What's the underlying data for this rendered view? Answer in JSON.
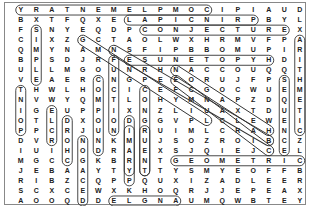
{
  "puzzle": {
    "type": "word-search",
    "rows": [
      "YRATNEMELPMOCIPIAUD",
      "BXTFQXELAPICNIRPBYL",
      "FSNYEQDPCONJECTUREX",
      "CIXZGCTAOLWXHRMVFPA",
      "QMYNAMNSFIPBBOMUPIR",
      "BPSDJRFESUNETOPYHDI",
      "ULLMGOUNRHNACCOUQQT",
      "VEAERCNGPEEORUJFPSH",
      "THWLHOCICEFCGOCWUEM",
      "NVWYQMTLOHYMNAPZDQE",
      "IGEUPPIXNZLIUAXTDUT",
      "OTLDXOODGGVPLCLEWEI",
      "PPCRJUNIRUIMLCRAHNC",
      "DVRONNKMUJSOZROIBCZ",
      "IUIHODRAEXSJQIEJCEL",
      "MGCCGKBRNTGEOMETRIC",
      "JEBAAYTYTTYSMYEOFFB",
      "RIBZCQPPQUXIZADLEER",
      "SCXCEWXKHOQRJJEPEAX",
      "AOOQDDELGNAUMQWBTEY"
    ],
    "found_words": [
      {
        "word": "COMPLEMENTARY",
        "r1": 0,
        "c1": 12,
        "r2": 0,
        "c2": 0
      },
      {
        "word": "PRINCIPAL",
        "r1": 1,
        "c1": 15,
        "r2": 1,
        "c2": 7
      },
      {
        "word": "CONJECTURE",
        "r1": 2,
        "c1": 8,
        "r2": 2,
        "c2": 17
      },
      {
        "word": "HYPOTENUSE",
        "r1": 5,
        "c1": 16,
        "r2": 5,
        "c2": 7
      },
      {
        "word": "GEOMETRIC",
        "r1": 15,
        "c1": 10,
        "r2": 15,
        "c2": 18
      },
      {
        "word": "ANGLE",
        "r1": 19,
        "c1": 10,
        "r2": 19,
        "c2": 6
      },
      {
        "word": "SIMPLE",
        "r1": 2,
        "c1": 1,
        "r2": 7,
        "c2": 1
      },
      {
        "word": "ARITHMETIC",
        "r1": 3,
        "c1": 18,
        "r2": 12,
        "c2": 18
      },
      {
        "word": "FUNCTION",
        "r1": 5,
        "c1": 6,
        "r2": 12,
        "c2": 6
      },
      {
        "word": "SEQUENCE",
        "r1": 7,
        "c1": 17,
        "r2": 14,
        "c2": 17
      },
      {
        "word": "TNIOP",
        "r1": 8,
        "c1": 0,
        "r2": 12,
        "c2": 0
      },
      {
        "word": "COMPOUND",
        "r1": 7,
        "c1": 5,
        "r2": 14,
        "c2": 5
      },
      {
        "word": "CONGRUENT",
        "r1": 8,
        "c1": 8,
        "r2": 16,
        "c2": 8
      },
      {
        "word": "DIMIDM",
        "r1": 11,
        "c1": 7,
        "r2": 16,
        "c2": 7
      },
      {
        "word": "ELEMENTS",
        "r1": 10,
        "c1": 2,
        "r2": 13,
        "c2": 2
      },
      {
        "word": "DOMAIN",
        "r1": 11,
        "c1": 3,
        "r2": 15,
        "c2": 3
      },
      {
        "word": "DECAGON",
        "r1": 19,
        "c1": 4,
        "r2": 13,
        "c2": 4
      },
      {
        "word": "PRIMARY",
        "r1": 17,
        "c1": 7,
        "r2": 12,
        "c2": 7
      },
      {
        "word": "TNEURGNOC",
        "r1": 16,
        "c1": 8,
        "r2": 12,
        "c2": 8
      },
      {
        "word": "GCTANGENT",
        "r1": 3,
        "c1": 4,
        "r2": 11,
        "c2": 12
      },
      {
        "word": "DIAGONAL",
        "r1": 4,
        "c1": 6,
        "r2": 13,
        "c2": 16
      },
      {
        "word": "NCIRCLE",
        "r1": 6,
        "c1": 10,
        "r2": 12,
        "c2": 16
      },
      {
        "word": "EFCLACA",
        "r1": 7,
        "c1": 10,
        "r2": 14,
        "c2": 16
      }
    ],
    "colors": {
      "text": "#222222",
      "circle": "#333333",
      "border": "#888888",
      "background": "#ffffff"
    }
  }
}
